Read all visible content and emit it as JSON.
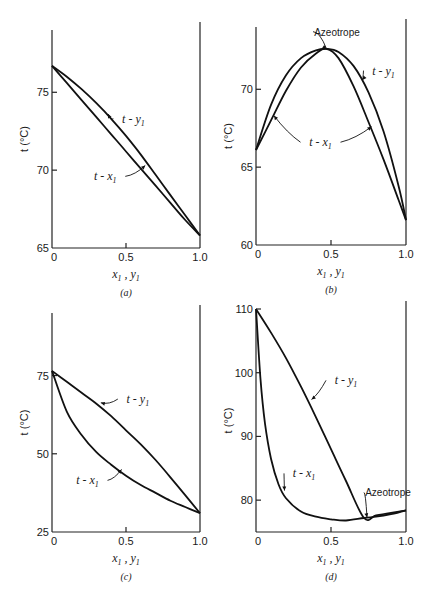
{
  "figure": {
    "panels_count": 4
  },
  "chart_data": [
    {
      "id": "a",
      "type": "line",
      "caption": "(a)",
      "title": "",
      "xlabel": "x1 , y1",
      "ylabel": "t (°C)",
      "xlim": [
        0,
        1.0
      ],
      "ylim": [
        65,
        79
      ],
      "xticks": [
        0,
        0.5,
        1.0
      ],
      "xtick_labels": [
        "0",
        "0.5",
        "1.0"
      ],
      "yticks": [
        65,
        70,
        75
      ],
      "ytick_labels": [
        "65",
        "70",
        "75"
      ],
      "grid": false,
      "box": {
        "x0": 52,
        "y0": 30,
        "x1": 200,
        "y1": 248
      },
      "series": [
        {
          "name": "t - y1",
          "x": [
            0,
            0.1,
            0.2,
            0.3,
            0.4,
            0.5,
            0.6,
            0.7,
            0.8,
            0.9,
            1.0
          ],
          "y": [
            76.7,
            76.0,
            75.2,
            74.3,
            73.3,
            72.2,
            71.0,
            69.7,
            68.4,
            67.1,
            65.8
          ]
        },
        {
          "name": "t - x1",
          "x": [
            0,
            0.1,
            0.2,
            0.3,
            0.4,
            0.5,
            0.6,
            0.7,
            0.8,
            0.9,
            1.0
          ],
          "y": [
            76.7,
            75.6,
            74.5,
            73.4,
            72.3,
            71.2,
            70.1,
            69.0,
            67.9,
            66.8,
            65.8
          ]
        }
      ],
      "annotations": [
        {
          "text": "t - y1",
          "label_x": 0.55,
          "label_y": 73.3,
          "arrow_to_x": 0.38,
          "arrow_to_y": 73.6
        },
        {
          "text": "t - x1",
          "label_x": 0.36,
          "label_y": 69.6,
          "arrow_to_x": 0.63,
          "arrow_to_y": 70.3
        }
      ]
    },
    {
      "id": "b",
      "type": "line",
      "caption": "(b)",
      "title": "",
      "xlabel": "x1 , y1",
      "ylabel": "t (°C)",
      "xlim": [
        0,
        1.0
      ],
      "ylim": [
        60,
        74
      ],
      "xticks": [
        0,
        0.5,
        1.0
      ],
      "xtick_labels": [
        "0",
        "0.5",
        "1.0"
      ],
      "yticks": [
        60,
        65,
        70
      ],
      "ytick_labels": [
        "60",
        "65",
        "70"
      ],
      "grid": false,
      "box": {
        "x0": 256,
        "y0": 27,
        "x1": 406,
        "y1": 245
      },
      "series": [
        {
          "name": "t - y1",
          "x": [
            0,
            0.1,
            0.2,
            0.3,
            0.4,
            0.47,
            0.55,
            0.65,
            0.75,
            0.85,
            0.95,
            1.0
          ],
          "y": [
            66.1,
            69.0,
            70.9,
            72.0,
            72.5,
            72.6,
            72.4,
            71.5,
            69.8,
            67.3,
            63.8,
            61.6
          ]
        },
        {
          "name": "t - x1",
          "x": [
            0,
            0.1,
            0.2,
            0.3,
            0.4,
            0.47,
            0.55,
            0.65,
            0.75,
            0.85,
            0.95,
            1.0
          ],
          "y": [
            66.1,
            68.0,
            69.9,
            71.4,
            72.3,
            72.6,
            72.0,
            70.2,
            67.9,
            65.5,
            62.9,
            61.6
          ]
        }
      ],
      "annotations": [
        {
          "text": "Azeotrope",
          "label_x": 0.54,
          "label_y": 73.7,
          "arrow_to_x": 0.47,
          "arrow_to_y": 72.6
        },
        {
          "text": "t - y1",
          "label_x": 0.85,
          "label_y": 71.2,
          "arrow_to_x": 0.71,
          "arrow_to_y": 70.6
        },
        {
          "text": "t - x1",
          "label_x": 0.43,
          "label_y": 66.6,
          "arrow_to_x": [
            0.12,
            0.77
          ],
          "arrow_to_y": [
            68.3,
            67.6
          ]
        }
      ]
    },
    {
      "id": "c",
      "type": "line",
      "caption": "(c)",
      "title": "",
      "xlabel": "x1 , y1",
      "ylabel": "t (°C)",
      "xlim": [
        0,
        1.0
      ],
      "ylim": [
        25,
        95
      ],
      "xticks": [
        0,
        0.5,
        1.0
      ],
      "xtick_labels": [
        "0",
        "0.5",
        "1.0"
      ],
      "yticks": [
        25,
        50,
        75
      ],
      "ytick_labels": [
        "25",
        "50",
        "75"
      ],
      "grid": false,
      "box": {
        "x0": 52,
        "y0": 313,
        "x1": 200,
        "y1": 532
      },
      "series": [
        {
          "name": "t - y1",
          "x": [
            0,
            0.1,
            0.2,
            0.3,
            0.4,
            0.5,
            0.6,
            0.7,
            0.8,
            0.9,
            1.0
          ],
          "y": [
            76.5,
            73.0,
            69.5,
            66.0,
            62.0,
            57.5,
            53.0,
            48.0,
            42.5,
            36.8,
            31.0
          ]
        },
        {
          "name": "t - x1",
          "x": [
            0,
            0.1,
            0.2,
            0.3,
            0.4,
            0.5,
            0.6,
            0.7,
            0.8,
            0.9,
            1.0
          ],
          "y": [
            76.5,
            63.5,
            56.0,
            50.5,
            46.5,
            43.0,
            40.0,
            37.5,
            35.0,
            33.0,
            31.0
          ]
        }
      ],
      "annotations": [
        {
          "text": "t - y1",
          "label_x": 0.58,
          "label_y": 67.5,
          "arrow_to_x": 0.33,
          "arrow_to_y": 66.3
        },
        {
          "text": "t - x1",
          "label_x": 0.24,
          "label_y": 41.5,
          "arrow_to_x": 0.47,
          "arrow_to_y": 45.0
        }
      ]
    },
    {
      "id": "d",
      "type": "line",
      "caption": "(d)",
      "title": "",
      "xlabel": "x1 , y1",
      "ylabel": "t (°C)",
      "xlim": [
        0,
        1.0
      ],
      "ylim": [
        75,
        110
      ],
      "xticks": [
        0,
        0.5,
        1.0
      ],
      "xtick_labels": [
        "0",
        "0.5",
        "1.0"
      ],
      "yticks": [
        80,
        90,
        100,
        110
      ],
      "ytick_labels": [
        "80",
        "90",
        "100",
        "110"
      ],
      "grid": false,
      "box": {
        "x0": 256,
        "y0": 309,
        "x1": 406,
        "y1": 532
      },
      "series": [
        {
          "name": "t - y1",
          "x": [
            0,
            0.1,
            0.2,
            0.3,
            0.4,
            0.5,
            0.6,
            0.72,
            0.8,
            0.9,
            1.0
          ],
          "y": [
            110,
            106.3,
            102.3,
            97.8,
            93.0,
            88.0,
            83.0,
            77.2,
            77.6,
            78.0,
            78.4
          ]
        },
        {
          "name": "t - x1",
          "x": [
            0,
            0.03,
            0.06,
            0.1,
            0.15,
            0.2,
            0.3,
            0.4,
            0.5,
            0.6,
            0.72,
            0.8,
            0.9,
            1.0
          ],
          "y": [
            110,
            99.0,
            92.0,
            86.5,
            82.5,
            80.3,
            78.2,
            77.4,
            77.0,
            76.8,
            77.2,
            77.4,
            77.8,
            78.4
          ]
        }
      ],
      "annotations": [
        {
          "text": "t - y1",
          "label_x": 0.6,
          "label_y": 98.8,
          "arrow_to_x": 0.37,
          "arrow_to_y": 95.8
        },
        {
          "text": "t - x1",
          "label_x": 0.32,
          "label_y": 84.2,
          "arrow_to_x": 0.19,
          "arrow_to_y": 81.5
        },
        {
          "text": "Azeotrope",
          "label_x": 0.88,
          "label_y": 81.2,
          "arrow_to_x": 0.74,
          "arrow_to_y": 77.3
        }
      ]
    }
  ]
}
